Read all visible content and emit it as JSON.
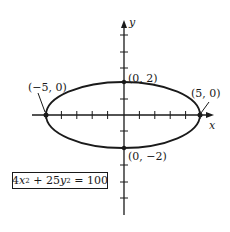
{
  "diagram": {
    "type": "ellipse-graph",
    "axes": {
      "x_label": "x",
      "y_label": "y"
    },
    "points": [
      {
        "label": "(−5, 0)",
        "x": -5,
        "y": 0
      },
      {
        "label": "(5, 0)",
        "x": 5,
        "y": 0
      },
      {
        "label": "(0, 2)",
        "x": 0,
        "y": 2
      },
      {
        "label": "(0, −2)",
        "x": 0,
        "y": -2
      }
    ],
    "equation": {
      "coef_x": "4",
      "var_x": "x",
      "plus": " + ",
      "coef_y": "25",
      "var_y": "y",
      "exp": "2",
      "rhs": " = 100"
    },
    "colors": {
      "ink": "#1a1a1a",
      "background": "#ffffff"
    }
  }
}
